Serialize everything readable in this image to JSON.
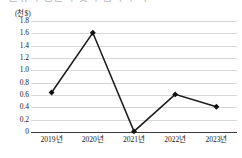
{
  "title_sliver": {
    "text": "원유 수입단가 및 수입액 추이"
  },
  "chart_data": {
    "type": "line",
    "title": "",
    "unit_label": "(천$)",
    "xlabel": "",
    "ylabel": "",
    "categories": [
      "2019년",
      "2020년",
      "2021년",
      "2022년",
      "2023년"
    ],
    "values": [
      0.64,
      1.61,
      0.01,
      0.61,
      0.41
    ],
    "series": [
      {
        "name": "",
        "values": [
          0.64,
          1.61,
          0.01,
          0.61,
          0.41
        ]
      }
    ],
    "ylim": [
      0,
      1.8
    ],
    "yticks": [
      0,
      0.2,
      0.4,
      0.6,
      0.8,
      1.0,
      1.2,
      1.4,
      1.6,
      1.8
    ],
    "ytick_labels": [
      "0",
      "0.2",
      "0.4",
      "0.6",
      "0.8",
      "1.0",
      "1.2",
      "1.4",
      "1.6",
      "1.8"
    ],
    "grid": true,
    "legend": false,
    "legend_position": "none",
    "line_color": "#1a1a1a",
    "marker": "diamond",
    "marker_color": "#111111",
    "gridline_color": "#d8d8dc",
    "axis_color": "#3a3a3a",
    "background_color": "#ffffff"
  }
}
